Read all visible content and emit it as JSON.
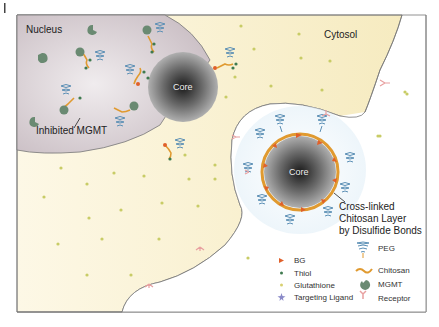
{
  "labels": {
    "nucleus": "Nucleus",
    "cytosol": "Cytosol",
    "core_left": "Core",
    "core_right": "Core",
    "inhibited_mgmt": "Inhibited MGMT",
    "crosslinked_1": "Cross-linked",
    "crosslinked_2": "Chitosan Layer",
    "crosslinked_3": "by Disulfide Bonds"
  },
  "legend": {
    "left": [
      {
        "label": "BG",
        "icon": "triangle-icon",
        "color": "#e0602a"
      },
      {
        "label": "Thiol",
        "icon": "dot-icon",
        "color": "#3f7a4f"
      },
      {
        "label": "Glutathione",
        "icon": "dot-icon",
        "color": "#d8d070"
      },
      {
        "label": "Targeting Ligand",
        "icon": "star-icon",
        "color": "#8a8ac8"
      }
    ],
    "right": [
      {
        "label": "PEG",
        "icon": "coil-icon",
        "color": "#5b8fb5"
      },
      {
        "label": "Chitosan",
        "icon": "wave-icon",
        "color": "#e09a30"
      },
      {
        "label": "MGMT",
        "icon": "pacman-icon",
        "color": "#6a8a72"
      },
      {
        "label": "Receptor",
        "icon": "y-receptor-icon",
        "color": "#e8a0a0"
      }
    ]
  },
  "colors": {
    "nucleus": "#cfc4c8",
    "cytosol": "#f8efc8",
    "extracellular": "#ffffff",
    "endosome": "#e8f2f8",
    "core": "#555555",
    "chitosan": "#e09a30"
  }
}
